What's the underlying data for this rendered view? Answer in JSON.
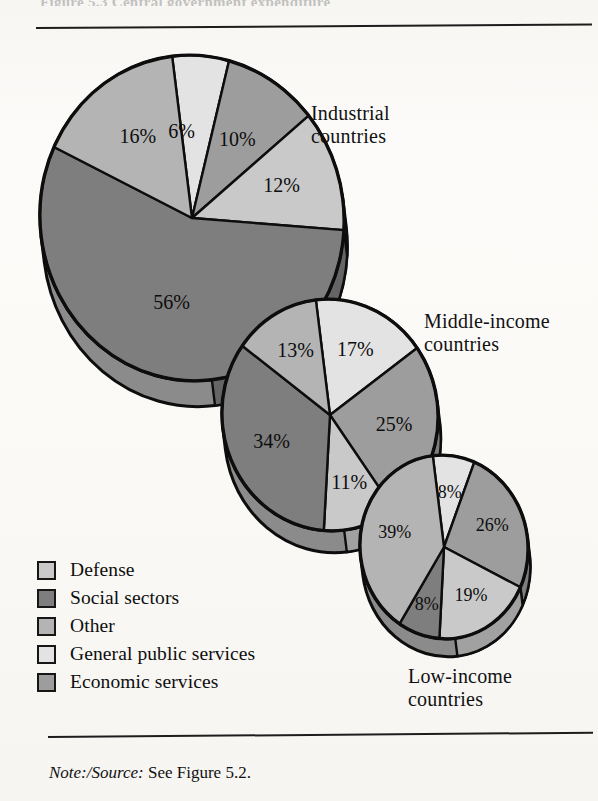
{
  "figure": {
    "top_sliver_text": "Figure 5.3  Central government expenditure",
    "note_prefix": "Note:/Source:",
    "note_text": " See Figure 5.2."
  },
  "legend": {
    "items": [
      {
        "label": "Defense",
        "key": "defense",
        "color": "#c9c9c9"
      },
      {
        "label": "Social sectors",
        "key": "social_sectors",
        "color": "#7e7e7e"
      },
      {
        "label": "Other",
        "key": "other",
        "color": "#b4b4b4"
      },
      {
        "label": "General public services",
        "key": "general_public",
        "color": "#e3e3e3"
      },
      {
        "label": "Economic services",
        "key": "economic",
        "color": "#9d9d9d"
      }
    ]
  },
  "captions": {
    "industrial": "Industrial\ncountries",
    "middle": "Middle-income\ncountries",
    "low": "Low-income\ncountries"
  },
  "chart_data": {
    "type": "pie",
    "xlabel": "",
    "ylabel": "",
    "grid": false,
    "legend_position": "bottom-left",
    "value_unit": "percent",
    "categories": [
      "General public services",
      "Economic services",
      "Defense",
      "Social sectors",
      "Other"
    ],
    "colors": {
      "General public services": "#e3e3e3",
      "Economic services": "#9d9d9d",
      "Defense": "#c9c9c9",
      "Social sectors": "#7e7e7e",
      "Other": "#b4b4b4"
    },
    "charts": [
      {
        "name": "industrial",
        "label": "Industrial countries",
        "cx": 192,
        "cy": 186,
        "rx": 152,
        "ry": 163,
        "depth": 26,
        "rot": -7,
        "start_angle": 0,
        "slices": [
          {
            "category": "General public services",
            "value": 6,
            "label": "6%",
            "lx": 0.52,
            "la": -0.5
          },
          {
            "category": "Economic services",
            "value": 10,
            "label": "10%",
            "lx": 0.56,
            "la": 0.0
          },
          {
            "category": "Defense",
            "value": 12,
            "label": "12%",
            "lx": 0.62,
            "la": 0.0
          },
          {
            "category": "Social sectors",
            "value": 56,
            "label": "56%",
            "lx": 0.55,
            "la": 0.0
          },
          {
            "category": "Other",
            "value": 16,
            "label": "16%",
            "lx": 0.6,
            "la": 0.0
          }
        ]
      },
      {
        "name": "middle",
        "label": "Middle-income countries",
        "cx": 330,
        "cy": 383,
        "rx": 108,
        "ry": 116,
        "depth": 22,
        "rot": -7,
        "start_angle": 0,
        "slices": [
          {
            "category": "General public services",
            "value": 17,
            "label": "17%",
            "lx": 0.6,
            "la": 0.0
          },
          {
            "category": "Economic services",
            "value": 25,
            "label": "25%",
            "lx": 0.6,
            "la": 0.0
          },
          {
            "category": "Defense",
            "value": 11,
            "label": "11%",
            "lx": 0.62,
            "la": 0.0
          },
          {
            "category": "Social sectors",
            "value": 34,
            "label": "34%",
            "lx": 0.6,
            "la": 0.0
          },
          {
            "category": "Other",
            "value": 13,
            "label": "13%",
            "lx": 0.62,
            "la": 0.0
          }
        ]
      },
      {
        "name": "low",
        "label": "Low-income countries",
        "cx": 444,
        "cy": 515,
        "rx": 84,
        "ry": 92,
        "depth": 18,
        "rot": -7,
        "start_angle": 0,
        "slices": [
          {
            "category": "General public services",
            "value": 8,
            "label": "8%",
            "lx": 0.58,
            "la": 0.0
          },
          {
            "category": "Economic services",
            "value": 26,
            "label": "26%",
            "lx": 0.62,
            "la": 0.0
          },
          {
            "category": "Defense",
            "value": 19,
            "label": "19%",
            "lx": 0.62,
            "la": 0.0
          },
          {
            "category": "Social sectors",
            "value": 8,
            "label": "8%",
            "lx": 0.68,
            "la": 0.0
          },
          {
            "category": "Other",
            "value": 39,
            "label": "39%",
            "lx": 0.6,
            "la": 0.0
          }
        ]
      }
    ]
  }
}
